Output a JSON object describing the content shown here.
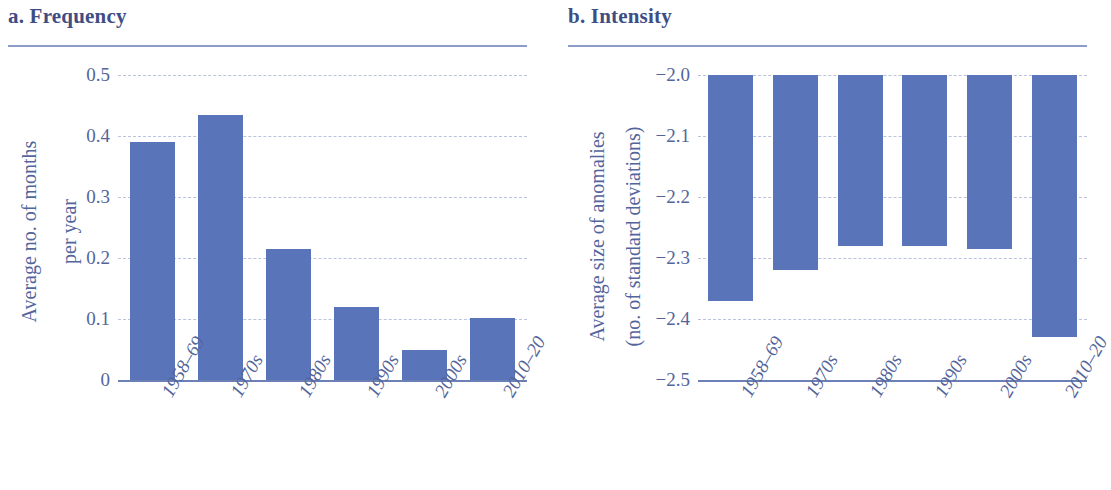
{
  "figure": {
    "panels": [
      {
        "key": "a",
        "title": "a. Frequency",
        "ylabel_line1": "Average no. of months",
        "ylabel_line2": "per year"
      },
      {
        "key": "b",
        "title": "b. Intensity",
        "ylabel_line1": "Average size of anomalies",
        "ylabel_line2": "(no. of standard deviations)"
      }
    ],
    "colors": {
      "bar": "#5a74ba",
      "title_text": "#3e4e84",
      "tick_text": "#54659b",
      "gridline": "#b9c3dd",
      "axis_line": "#6d80b5",
      "rule": "#8d9cc6",
      "background": "#ffffff"
    }
  },
  "chart_data": [
    {
      "type": "bar",
      "title": "a. Frequency",
      "categories": [
        "1958–69",
        "1970s",
        "1980s",
        "1990s",
        "2000s",
        "2010–20"
      ],
      "values": [
        0.39,
        0.435,
        0.215,
        0.12,
        0.05,
        0.102
      ],
      "xlabel": "",
      "ylabel": "Average no. of months per year",
      "ylim": [
        0,
        0.5
      ],
      "yticks": [
        0,
        0.1,
        0.2,
        0.3,
        0.4,
        0.5
      ],
      "ytick_labels": [
        "0",
        "0.1",
        "0.2",
        "0.3",
        "0.4",
        "0.5"
      ],
      "grid": true,
      "legend": false
    },
    {
      "type": "bar",
      "title": "b. Intensity",
      "categories": [
        "1958–69",
        "1970s",
        "1980s",
        "1990s",
        "2000s",
        "2010–20"
      ],
      "values": [
        -2.37,
        -2.32,
        -2.28,
        -2.28,
        -2.285,
        -2.43
      ],
      "baseline": -2.0,
      "xlabel": "",
      "ylabel": "Average size of anomalies (no. of standard deviations)",
      "ylim": [
        -2.5,
        -2.0
      ],
      "yticks": [
        -2.5,
        -2.4,
        -2.3,
        -2.2,
        -2.1,
        -2.0
      ],
      "ytick_labels": [
        "−2.5",
        "−2.4",
        "−2.3",
        "−2.2",
        "−2.1",
        "−2.0"
      ],
      "grid": true,
      "legend": false
    }
  ]
}
